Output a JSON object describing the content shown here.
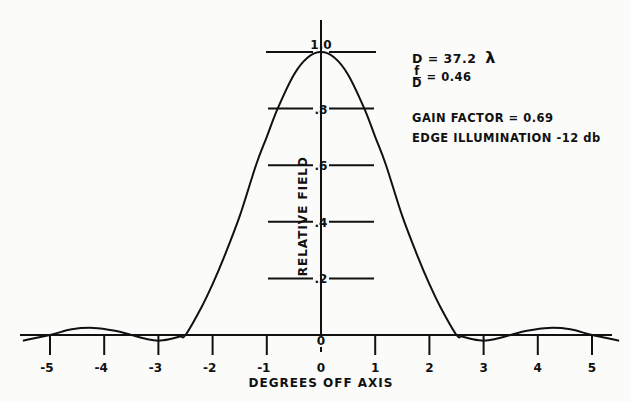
{
  "chart_data": {
    "type": "line",
    "title": "",
    "xlabel": "DEGREES OFF AXIS",
    "ylabel": "RELATIVE FIELD",
    "xlim": [
      -5.5,
      5.5
    ],
    "ylim": [
      -0.05,
      1.05
    ],
    "x_ticks": [
      -5,
      -4,
      -3,
      -2,
      -1,
      0,
      1,
      2,
      3,
      4,
      5
    ],
    "x_tick_labels": [
      "-5",
      "-4",
      "-3",
      "-2",
      "-1",
      "0",
      "1",
      "2",
      "3",
      "4",
      "5"
    ],
    "y_ticks": [
      0.2,
      0.4,
      0.6,
      0.8,
      1.0
    ],
    "y_tick_labels": [
      ".2",
      ".4",
      ".6",
      ".8",
      "1.0"
    ],
    "origin_label": "0",
    "grid": false,
    "series": [
      {
        "name": "Relative field pattern",
        "x": [
          -5.5,
          -5.0,
          -4.6,
          -4.2,
          -3.8,
          -3.5,
          -3.2,
          -3.0,
          -2.8,
          -2.6,
          -2.5,
          -2.2,
          -2.0,
          -1.8,
          -1.5,
          -1.2,
          -1.0,
          -0.8,
          -0.5,
          -0.25,
          0.0,
          0.25,
          0.5,
          0.8,
          1.0,
          1.2,
          1.5,
          1.8,
          2.0,
          2.2,
          2.5,
          2.6,
          2.8,
          3.0,
          3.2,
          3.5,
          3.8,
          4.2,
          4.6,
          5.0,
          5.5
        ],
        "y": [
          -0.02,
          0.0,
          0.02,
          0.025,
          0.015,
          0.0,
          -0.015,
          -0.02,
          -0.015,
          -0.005,
          0.0,
          0.1,
          0.18,
          0.27,
          0.42,
          0.6,
          0.7,
          0.8,
          0.92,
          0.98,
          1.0,
          0.98,
          0.92,
          0.8,
          0.7,
          0.6,
          0.42,
          0.27,
          0.18,
          0.1,
          0.0,
          -0.005,
          -0.015,
          -0.02,
          -0.015,
          0.0,
          0.015,
          0.025,
          0.02,
          0.0,
          -0.02
        ]
      }
    ],
    "annotations": [
      "D = 37.2 λ",
      "f/D = 0.46",
      "GAIN FACTOR = 0.69",
      "EDGE ILLUMINATION -12 db"
    ],
    "legend": null
  },
  "annotations": {
    "diameter_label": "D = 37.2",
    "lambda": "λ",
    "fd_num": "f",
    "fd_den": "D",
    "fd_value": "= 0.46",
    "gain": "GAIN  FACTOR = 0.69",
    "edge": "EDGE  ILLUMINATION -12 db"
  }
}
